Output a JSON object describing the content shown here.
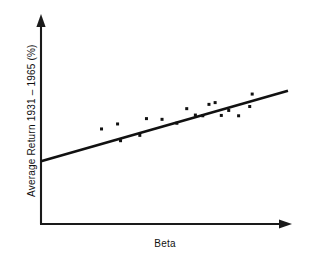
{
  "chart_data": {
    "type": "scatter",
    "title": "",
    "subtitle": "",
    "xlabel": "Beta",
    "ylabel": "Average Return 1931 – 1965 (%)",
    "xlim": [
      0,
      1
    ],
    "ylim": [
      0,
      1
    ],
    "grid": false,
    "legend": null,
    "axis_ticks": "none",
    "axes_style": "arrow-tipped open axes (left and bottom only)",
    "marker": {
      "shape": "square-dot",
      "size_px": 3,
      "color": "#111111"
    },
    "points": [
      {
        "x": 0.245,
        "y": 0.534
      },
      {
        "x": 0.31,
        "y": 0.562
      },
      {
        "x": 0.322,
        "y": 0.468
      },
      {
        "x": 0.4,
        "y": 0.498
      },
      {
        "x": 0.427,
        "y": 0.592
      },
      {
        "x": 0.49,
        "y": 0.588
      },
      {
        "x": 0.55,
        "y": 0.566
      },
      {
        "x": 0.59,
        "y": 0.648
      },
      {
        "x": 0.625,
        "y": 0.612
      },
      {
        "x": 0.655,
        "y": 0.608
      },
      {
        "x": 0.68,
        "y": 0.672
      },
      {
        "x": 0.705,
        "y": 0.682
      },
      {
        "x": 0.73,
        "y": 0.61
      },
      {
        "x": 0.76,
        "y": 0.638
      },
      {
        "x": 0.8,
        "y": 0.608
      },
      {
        "x": 0.845,
        "y": 0.66
      },
      {
        "x": 0.855,
        "y": 0.73
      }
    ],
    "fit_line": {
      "kind": "linear-regression",
      "x_start": 0.0,
      "y_start": 0.352,
      "x_end": 1.0,
      "y_end": 0.748,
      "color": "#111111",
      "width_px": 2.6
    },
    "colors": {
      "background": "#ffffff",
      "foreground": "#111111",
      "axis": "#1a1a1a"
    }
  }
}
